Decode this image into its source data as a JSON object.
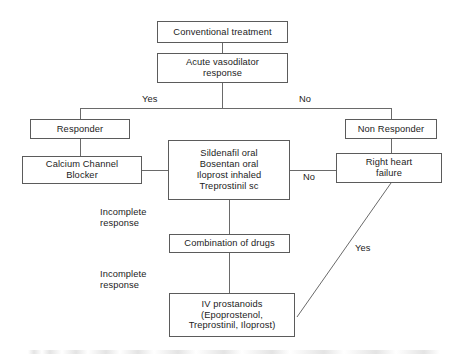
{
  "diagram": {
    "type": "flowchart",
    "nodes": [
      {
        "id": "conventional-treatment",
        "label": "Conventional treatment"
      },
      {
        "id": "acute-vasodilator-response",
        "label": "Acute vasodilator\nresponse"
      },
      {
        "id": "responder",
        "label": "Responder"
      },
      {
        "id": "non-responder",
        "label": "Non Responder"
      },
      {
        "id": "calcium-channel-blocker",
        "label": "Calcium Channel\nBlocker"
      },
      {
        "id": "oral-inhaled-therapy",
        "label": "Sildenafil oral\nBosentan oral\nIloprost inhaled\nTreprostinil sc"
      },
      {
        "id": "right-heart-failure",
        "label": "Right heart\nfailure"
      },
      {
        "id": "combination-of-drugs",
        "label": "Combination of drugs"
      },
      {
        "id": "iv-prostanoids",
        "label": "IV prostanoids\n(Epoprostenol,\nTreprostinil, Iloprost)"
      }
    ],
    "edge_labels": [
      {
        "id": "yes-branch",
        "label": "Yes"
      },
      {
        "id": "no-branch",
        "label": "No"
      },
      {
        "id": "no-right-heart-failure",
        "label": "No"
      },
      {
        "id": "incomplete-response-1",
        "label": "Incomplete\nresponse"
      },
      {
        "id": "incomplete-response-2",
        "label": "Incomplete\nresponse"
      },
      {
        "id": "yes-diagonal",
        "label": "Yes"
      }
    ],
    "colors": {
      "background": "#ffffff",
      "box_border": "#5b5b5b",
      "connector": "#6a6a6a",
      "text": "#1c1c1c"
    }
  }
}
